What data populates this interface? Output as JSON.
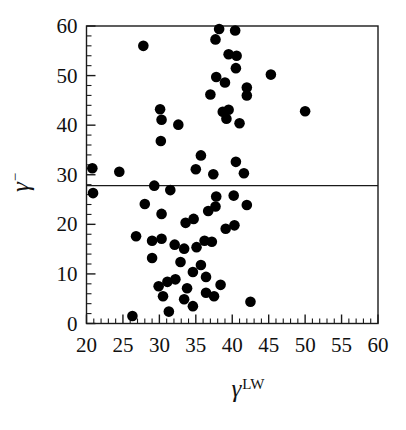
{
  "figure": {
    "background": "#ffffff",
    "axis_color": "#1a1a1a",
    "dot_color": "#000000"
  },
  "chart_data": {
    "type": "scatter",
    "title": "",
    "xlabel_base": "γ",
    "xlabel_sup": "LW",
    "ylabel_base": "γ",
    "ylabel_sup": "−",
    "xlim": [
      20,
      60
    ],
    "ylim": [
      0,
      60
    ],
    "x_ticks": [
      20,
      25,
      30,
      35,
      40,
      45,
      50,
      55,
      60
    ],
    "x_minor_step": 1,
    "y_ticks": [
      0,
      10,
      20,
      30,
      40,
      50,
      60
    ],
    "y_minor_step": 2,
    "grid": false,
    "legend": "none",
    "hline_y": 27.8,
    "points": [
      [
        27.8,
        56.0
      ],
      [
        38.2,
        59.4
      ],
      [
        40.4,
        59.1
      ],
      [
        37.7,
        57.3
      ],
      [
        39.5,
        54.3
      ],
      [
        40.6,
        54.0
      ],
      [
        40.5,
        51.5
      ],
      [
        45.3,
        50.2
      ],
      [
        37.8,
        49.7
      ],
      [
        39.0,
        48.6
      ],
      [
        42.0,
        47.6
      ],
      [
        42.0,
        46.0
      ],
      [
        37.0,
        46.2
      ],
      [
        30.1,
        43.2
      ],
      [
        30.3,
        41.1
      ],
      [
        32.6,
        40.1
      ],
      [
        38.7,
        42.7
      ],
      [
        39.5,
        43.1
      ],
      [
        39.2,
        41.3
      ],
      [
        41.0,
        40.4
      ],
      [
        50.0,
        42.8
      ],
      [
        30.2,
        36.8
      ],
      [
        20.8,
        31.3
      ],
      [
        24.5,
        30.6
      ],
      [
        35.7,
        33.9
      ],
      [
        40.5,
        32.6
      ],
      [
        35.0,
        31.1
      ],
      [
        37.4,
        30.1
      ],
      [
        41.6,
        30.3
      ],
      [
        20.9,
        26.3
      ],
      [
        29.3,
        27.8
      ],
      [
        31.5,
        26.9
      ],
      [
        28.0,
        24.1
      ],
      [
        37.8,
        25.6
      ],
      [
        40.2,
        25.8
      ],
      [
        30.3,
        22.1
      ],
      [
        37.7,
        23.6
      ],
      [
        42.0,
        23.9
      ],
      [
        36.7,
        22.7
      ],
      [
        34.7,
        21.1
      ],
      [
        33.6,
        20.3
      ],
      [
        39.1,
        19.1
      ],
      [
        40.3,
        19.8
      ],
      [
        26.8,
        17.6
      ],
      [
        29.0,
        16.7
      ],
      [
        30.3,
        17.1
      ],
      [
        32.1,
        15.9
      ],
      [
        36.2,
        16.7
      ],
      [
        37.2,
        16.5
      ],
      [
        35.1,
        15.4
      ],
      [
        33.4,
        15.1
      ],
      [
        29.0,
        13.2
      ],
      [
        32.9,
        12.4
      ],
      [
        35.7,
        11.8
      ],
      [
        34.6,
        10.4
      ],
      [
        36.4,
        9.4
      ],
      [
        29.9,
        7.5
      ],
      [
        31.1,
        8.4
      ],
      [
        32.2,
        8.9
      ],
      [
        38.4,
        7.8
      ],
      [
        30.5,
        5.5
      ],
      [
        33.8,
        7.1
      ],
      [
        33.4,
        4.9
      ],
      [
        34.6,
        3.5
      ],
      [
        36.4,
        6.2
      ],
      [
        37.5,
        5.5
      ],
      [
        42.5,
        4.4
      ],
      [
        31.3,
        2.4
      ],
      [
        26.3,
        1.5
      ]
    ]
  }
}
